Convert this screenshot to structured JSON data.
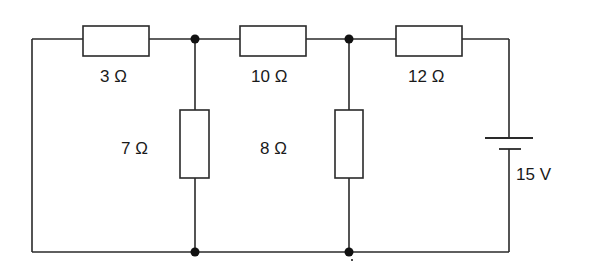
{
  "diagram": {
    "type": "circuit-schematic",
    "components": {
      "r1": {
        "label": "3 Ω",
        "value": "3",
        "unit": "Ω",
        "position": "top-left, series"
      },
      "r2": {
        "label": "10 Ω",
        "value": "10",
        "unit": "Ω",
        "position": "top-middle, series"
      },
      "r3": {
        "label": "12 Ω",
        "value": "12",
        "unit": "Ω",
        "position": "top-right, series"
      },
      "r4": {
        "label": "7 Ω",
        "value": "7",
        "unit": "Ω",
        "position": "vertical shunt, first junction"
      },
      "r5": {
        "label": "8 Ω",
        "value": "8",
        "unit": "Ω",
        "position": "vertical shunt, second junction"
      },
      "battery": {
        "label": "15 V",
        "value": "15",
        "unit": "V",
        "position": "right side"
      }
    },
    "junctions": 4,
    "colors": {
      "line": "#2a2a2a",
      "node": "#111111",
      "background": "#ffffff"
    }
  }
}
